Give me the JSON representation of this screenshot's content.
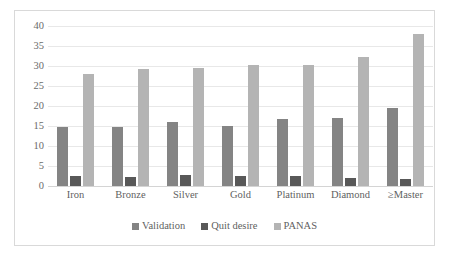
{
  "chart_data": {
    "type": "bar",
    "title": "",
    "subtitle": "",
    "xlabel": "",
    "ylabel": "",
    "ylim": [
      0,
      40
    ],
    "ytick_step": 5,
    "yticks": [
      "0",
      "5",
      "10",
      "15",
      "20",
      "25",
      "30",
      "35",
      "40"
    ],
    "grid": true,
    "legend_position": "bottom",
    "categories": [
      "Iron",
      "Bronze",
      "Silver",
      "Gold",
      "Platinum",
      "Diamond",
      "≥Master"
    ],
    "series": [
      {
        "name": "Validation",
        "color": "#848484",
        "values": [
          14.7,
          14.8,
          15.9,
          14.9,
          16.7,
          17.1,
          19.6
        ]
      },
      {
        "name": "Quit desire",
        "color": "#585858",
        "values": [
          2.4,
          2.2,
          2.8,
          2.6,
          2.5,
          1.9,
          1.7
        ]
      },
      {
        "name": "PANAS",
        "color": "#b4b4b4",
        "values": [
          27.9,
          29.2,
          29.6,
          30.2,
          30.2,
          32.2,
          37.9
        ]
      }
    ]
  },
  "colors": {
    "validation": "#848484",
    "quit_desire": "#585858",
    "panas": "#b4b4b4",
    "gridline": "#e8e8e8",
    "border": "#d9d9d9",
    "text": "#5f5f5f",
    "background": "#ffffff"
  }
}
